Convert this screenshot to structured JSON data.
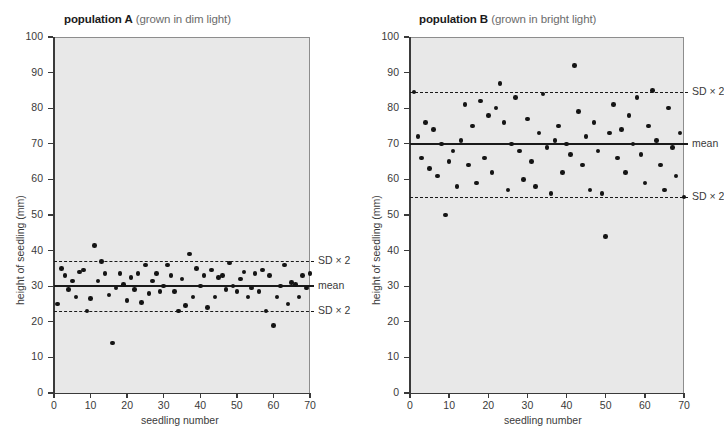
{
  "figure": {
    "y_axis_label": "height of seedling (mm)",
    "x_axis_label": "seedling number",
    "y_ticks": [
      0,
      10,
      20,
      30,
      40,
      50,
      60,
      70,
      80,
      90,
      100
    ],
    "x_ticks": [
      0,
      10,
      20,
      30,
      40,
      50,
      60,
      70
    ],
    "mean_label": "mean",
    "sd_label": "SD × 2",
    "plot_background": "#e8e8e8",
    "point_color": "#141414",
    "line_color": "#1a1a1a"
  },
  "panels": [
    {
      "id": "population-a",
      "title_strong": "population A",
      "title_soft": "(grown in dim light)",
      "mean": 30,
      "sd_upper": 37,
      "sd_lower": 23
    },
    {
      "id": "population-b",
      "title_strong": "population B",
      "title_soft": "(grown in bright light)",
      "mean": 70,
      "sd_upper": 84.5,
      "sd_lower": 55
    }
  ],
  "chart_data": [
    {
      "type": "scatter",
      "title": "population A (grown in dim light)",
      "xlabel": "seedling number",
      "ylabel": "height of seedling (mm)",
      "xlim": [
        0,
        70
      ],
      "ylim": [
        0,
        100
      ],
      "grid": false,
      "annotations": [
        {
          "label": "mean",
          "value": 30,
          "style": "solid"
        },
        {
          "label": "SD × 2",
          "value": 37,
          "style": "dashed"
        },
        {
          "label": "SD × 2",
          "value": 23,
          "style": "dashed"
        }
      ],
      "points": [
        {
          "x": 1,
          "y": 25
        },
        {
          "x": 2,
          "y": 35
        },
        {
          "x": 3,
          "y": 33
        },
        {
          "x": 4,
          "y": 29
        },
        {
          "x": 5,
          "y": 31.5
        },
        {
          "x": 6,
          "y": 27
        },
        {
          "x": 7,
          "y": 34
        },
        {
          "x": 8,
          "y": 34.5
        },
        {
          "x": 9,
          "y": 23
        },
        {
          "x": 10,
          "y": 26.5
        },
        {
          "x": 11,
          "y": 41.5
        },
        {
          "x": 12,
          "y": 31.5
        },
        {
          "x": 13,
          "y": 37
        },
        {
          "x": 14,
          "y": 33.5
        },
        {
          "x": 15,
          "y": 27.5
        },
        {
          "x": 16,
          "y": 14
        },
        {
          "x": 17,
          "y": 29.5
        },
        {
          "x": 18,
          "y": 33.5
        },
        {
          "x": 19,
          "y": 30.5
        },
        {
          "x": 20,
          "y": 26
        },
        {
          "x": 21,
          "y": 32.5
        },
        {
          "x": 22,
          "y": 29
        },
        {
          "x": 23,
          "y": 33.5
        },
        {
          "x": 24,
          "y": 25.5
        },
        {
          "x": 25,
          "y": 36
        },
        {
          "x": 26,
          "y": 28
        },
        {
          "x": 27,
          "y": 31.5
        },
        {
          "x": 28,
          "y": 33.5
        },
        {
          "x": 29,
          "y": 28.5
        },
        {
          "x": 30,
          "y": 30
        },
        {
          "x": 31,
          "y": 36
        },
        {
          "x": 32,
          "y": 33
        },
        {
          "x": 33,
          "y": 28.5
        },
        {
          "x": 34,
          "y": 23
        },
        {
          "x": 35,
          "y": 32
        },
        {
          "x": 36,
          "y": 24.5
        },
        {
          "x": 37,
          "y": 39
        },
        {
          "x": 38,
          "y": 27
        },
        {
          "x": 39,
          "y": 35
        },
        {
          "x": 40,
          "y": 30
        },
        {
          "x": 41,
          "y": 33
        },
        {
          "x": 42,
          "y": 24
        },
        {
          "x": 43,
          "y": 34.5
        },
        {
          "x": 44,
          "y": 27
        },
        {
          "x": 45,
          "y": 32.5
        },
        {
          "x": 46,
          "y": 33
        },
        {
          "x": 47,
          "y": 29
        },
        {
          "x": 48,
          "y": 36.5
        },
        {
          "x": 49,
          "y": 30
        },
        {
          "x": 50,
          "y": 28.5
        },
        {
          "x": 51,
          "y": 32
        },
        {
          "x": 52,
          "y": 34
        },
        {
          "x": 53,
          "y": 27
        },
        {
          "x": 54,
          "y": 29.5
        },
        {
          "x": 55,
          "y": 33.5
        },
        {
          "x": 56,
          "y": 28.5
        },
        {
          "x": 57,
          "y": 34.5
        },
        {
          "x": 58,
          "y": 23
        },
        {
          "x": 59,
          "y": 33
        },
        {
          "x": 60,
          "y": 19
        },
        {
          "x": 61,
          "y": 27
        },
        {
          "x": 62,
          "y": 30
        },
        {
          "x": 63,
          "y": 36
        },
        {
          "x": 64,
          "y": 25
        },
        {
          "x": 65,
          "y": 31
        },
        {
          "x": 66,
          "y": 30.5
        },
        {
          "x": 67,
          "y": 27
        },
        {
          "x": 68,
          "y": 33
        },
        {
          "x": 69,
          "y": 29.5
        },
        {
          "x": 70,
          "y": 33.5
        }
      ]
    },
    {
      "type": "scatter",
      "title": "population B (grown in bright light)",
      "xlabel": "seedling number",
      "ylabel": "height of seedling (mm)",
      "xlim": [
        0,
        70
      ],
      "ylim": [
        0,
        100
      ],
      "grid": false,
      "annotations": [
        {
          "label": "mean",
          "value": 70,
          "style": "solid"
        },
        {
          "label": "SD × 2",
          "value": 84.5,
          "style": "dashed"
        },
        {
          "label": "SD × 2",
          "value": 55,
          "style": "dashed"
        }
      ],
      "points": [
        {
          "x": 1,
          "y": 84.5
        },
        {
          "x": 2,
          "y": 72
        },
        {
          "x": 3,
          "y": 66
        },
        {
          "x": 4,
          "y": 76
        },
        {
          "x": 5,
          "y": 63
        },
        {
          "x": 6,
          "y": 74
        },
        {
          "x": 7,
          "y": 61
        },
        {
          "x": 8,
          "y": 70
        },
        {
          "x": 9,
          "y": 50
        },
        {
          "x": 10,
          "y": 65
        },
        {
          "x": 11,
          "y": 68
        },
        {
          "x": 12,
          "y": 58
        },
        {
          "x": 13,
          "y": 71
        },
        {
          "x": 14,
          "y": 81
        },
        {
          "x": 15,
          "y": 64
        },
        {
          "x": 16,
          "y": 75
        },
        {
          "x": 17,
          "y": 59
        },
        {
          "x": 18,
          "y": 82
        },
        {
          "x": 19,
          "y": 66
        },
        {
          "x": 20,
          "y": 78
        },
        {
          "x": 21,
          "y": 62
        },
        {
          "x": 22,
          "y": 80
        },
        {
          "x": 23,
          "y": 87
        },
        {
          "x": 24,
          "y": 76
        },
        {
          "x": 25,
          "y": 57
        },
        {
          "x": 26,
          "y": 70
        },
        {
          "x": 27,
          "y": 83
        },
        {
          "x": 28,
          "y": 68
        },
        {
          "x": 29,
          "y": 60
        },
        {
          "x": 30,
          "y": 77
        },
        {
          "x": 31,
          "y": 65
        },
        {
          "x": 32,
          "y": 58
        },
        {
          "x": 33,
          "y": 73
        },
        {
          "x": 34,
          "y": 84
        },
        {
          "x": 35,
          "y": 69
        },
        {
          "x": 36,
          "y": 56
        },
        {
          "x": 37,
          "y": 71
        },
        {
          "x": 38,
          "y": 75
        },
        {
          "x": 39,
          "y": 62
        },
        {
          "x": 40,
          "y": 70
        },
        {
          "x": 41,
          "y": 67
        },
        {
          "x": 42,
          "y": 92
        },
        {
          "x": 43,
          "y": 79
        },
        {
          "x": 44,
          "y": 64
        },
        {
          "x": 45,
          "y": 72
        },
        {
          "x": 46,
          "y": 57
        },
        {
          "x": 47,
          "y": 76
        },
        {
          "x": 48,
          "y": 68
        },
        {
          "x": 49,
          "y": 56
        },
        {
          "x": 50,
          "y": 44
        },
        {
          "x": 51,
          "y": 73
        },
        {
          "x": 52,
          "y": 81
        },
        {
          "x": 53,
          "y": 66
        },
        {
          "x": 54,
          "y": 74
        },
        {
          "x": 55,
          "y": 62
        },
        {
          "x": 56,
          "y": 78
        },
        {
          "x": 57,
          "y": 70
        },
        {
          "x": 58,
          "y": 83
        },
        {
          "x": 59,
          "y": 67
        },
        {
          "x": 60,
          "y": 59
        },
        {
          "x": 61,
          "y": 75
        },
        {
          "x": 62,
          "y": 85
        },
        {
          "x": 63,
          "y": 71
        },
        {
          "x": 64,
          "y": 64
        },
        {
          "x": 65,
          "y": 57
        },
        {
          "x": 66,
          "y": 80
        },
        {
          "x": 67,
          "y": 69
        },
        {
          "x": 68,
          "y": 61
        },
        {
          "x": 69,
          "y": 73
        },
        {
          "x": 70,
          "y": 55
        }
      ]
    }
  ]
}
